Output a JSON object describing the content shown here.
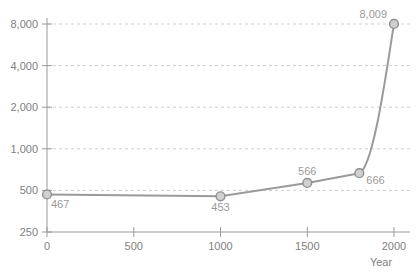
{
  "chart_data": {
    "type": "line",
    "title": "",
    "subtitle": "",
    "xlabel": "Year",
    "ylabel": "",
    "yscale": "log",
    "grid": true,
    "legend": false,
    "xlim": [
      0,
      2050
    ],
    "ylim": [
      250,
      8000
    ],
    "x_ticks": [
      {
        "value": 0,
        "label": "0"
      },
      {
        "value": 500,
        "label": "500"
      },
      {
        "value": 1000,
        "label": "1000"
      },
      {
        "value": 1500,
        "label": "1500"
      },
      {
        "value": 2000,
        "label": "2000"
      }
    ],
    "y_ticks": [
      {
        "value": 250,
        "label": "250"
      },
      {
        "value": 500,
        "label": "500"
      },
      {
        "value": 1000,
        "label": "1,000"
      },
      {
        "value": 2000,
        "label": "2,000"
      },
      {
        "value": 4000,
        "label": "4,000"
      },
      {
        "value": 8000,
        "label": "8,000"
      }
    ],
    "x": [
      0,
      1000,
      1500,
      1800,
      2000
    ],
    "values": [
      467,
      453,
      566,
      666,
      8009
    ],
    "point_labels": [
      "467",
      "453",
      "566",
      "666",
      "8,009"
    ],
    "series": [
      {
        "name": "population",
        "x": [
          0,
          1000,
          1500,
          1800,
          2000
        ],
        "values": [
          467,
          453,
          566,
          666,
          8009
        ]
      }
    ],
    "colors": {
      "line": "#9a9a9a",
      "marker_fill": "#d0d0d0",
      "marker_stroke": "#8f8f8f",
      "grid": "#cfcfcf",
      "axis": "#9a9a9a",
      "tick_text": "#808080",
      "label_text": "#9a9a9a",
      "background": "#ffffff"
    }
  }
}
